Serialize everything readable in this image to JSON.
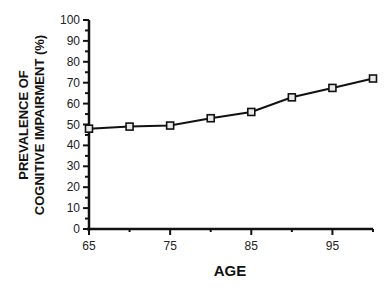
{
  "chart_data": {
    "type": "line",
    "title": "",
    "xlabel": "AGE",
    "ylabel_lines": [
      "PREVALENCE  OF",
      "COGNITIVE  IMPAIRMENT  (%)"
    ],
    "ylabel": "PREVALENCE OF COGNITIVE IMPAIRMENT (%)",
    "x": [
      65,
      70,
      75,
      80,
      85,
      90,
      95,
      100
    ],
    "series": [
      {
        "name": "Prevalence of cognitive impairment",
        "values": [
          48,
          49,
          49.5,
          53,
          56,
          63,
          67.5,
          72
        ],
        "marker": "square"
      }
    ],
    "xlim": [
      65,
      100
    ],
    "ylim": [
      0,
      100
    ],
    "xticks": [
      65,
      75,
      85,
      95
    ],
    "yticks": [
      0,
      10,
      20,
      30,
      40,
      50,
      60,
      70,
      80,
      90,
      100
    ],
    "grid": false,
    "legend": null
  },
  "colors": {
    "line": "#111111",
    "marker_fill": "#e8e8e8",
    "axis": "#111111"
  }
}
